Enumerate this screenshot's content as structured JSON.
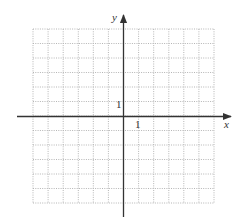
{
  "diagram": {
    "type": "coordinate-grid",
    "x_axis_label": "x",
    "y_axis_label": "y",
    "x_tick_label": "1",
    "y_tick_label": "1",
    "grid": {
      "columns": 12,
      "rows": 12,
      "x_range": [
        -6,
        6
      ],
      "y_range": [
        -6,
        6
      ],
      "line_style": "dotted"
    },
    "colors": {
      "axis": "#333333",
      "grid": "#b5b5b5",
      "background": "#ffffff"
    }
  }
}
